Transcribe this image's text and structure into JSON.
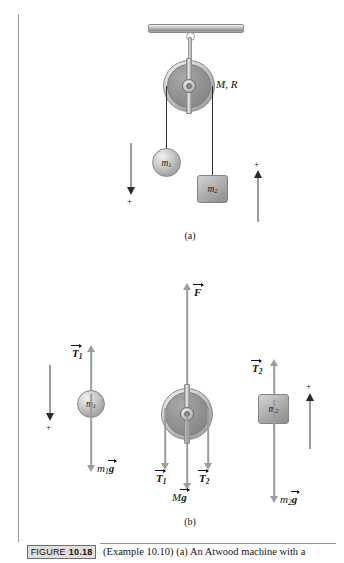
{
  "figure": {
    "number_prefix": "FIGURE",
    "number": "10.18",
    "caption": "(Example 10.10) (a) An Atwood machine with a",
    "panel_a_label": "(a)",
    "panel_b_label": "(b)"
  },
  "panel_a": {
    "pulley_label_M": "M",
    "pulley_label_comma": ",",
    "pulley_label_R": "R",
    "pulley_label_full": "M, R",
    "mass1_label": "m",
    "mass1_sub": "1",
    "mass2_label": "m",
    "mass2_sub": "2",
    "sign_left": "+",
    "sign_right": "+",
    "sign_left_direction": "down",
    "sign_right_direction": "up"
  },
  "panel_b": {
    "body1": {
      "mass_label": "m",
      "mass_sub": "1",
      "force_up": {
        "symbol": "T",
        "sub": "1",
        "vector": true
      },
      "force_down": {
        "symbol_lead": "m",
        "sub": "1",
        "symbol": "g",
        "vector": true
      }
    },
    "pulley": {
      "force_up": {
        "symbol": "F",
        "vector": true
      },
      "force_down_left": {
        "symbol": "T",
        "sub": "1",
        "vector": true
      },
      "force_down_right": {
        "symbol": "T",
        "sub": "2",
        "vector": true
      },
      "weight": {
        "symbol_lead": "M",
        "symbol": "g",
        "vector": true
      }
    },
    "body2": {
      "mass_label": "m",
      "mass_sub": "2",
      "force_up": {
        "symbol": "T",
        "sub": "2",
        "vector": true
      },
      "force_down": {
        "symbol_lead": "m",
        "sub": "2",
        "symbol": "g",
        "vector": true
      }
    },
    "sign_left": "+",
    "sign_right": "+",
    "sign_left_direction": "down",
    "sign_right_direction": "up"
  },
  "colors": {
    "page_background": "#ffffff",
    "ink": "#1b1b1b",
    "rule": "#9a9a9a",
    "cord": "#2c2c2c",
    "force_arrow": "#9d9d9d",
    "sign_arrow": "#2a2a2a",
    "metal_light": "#f0f0f0",
    "metal_mid": "#b0b0b0",
    "metal_dark": "#8c8c8c",
    "figure_box_fill": "#dededc"
  }
}
